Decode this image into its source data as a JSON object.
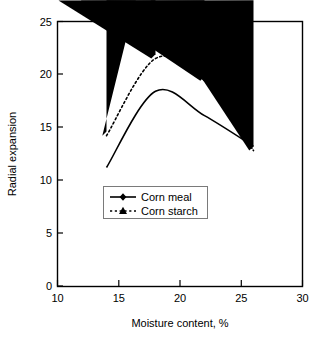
{
  "chart_data": {
    "type": "line",
    "title": "",
    "xlabel": "Moisture content, %",
    "ylabel": "Radial expansion",
    "xlim": [
      10,
      30
    ],
    "ylim": [
      0,
      25
    ],
    "xticks": [
      10,
      15,
      20,
      25,
      30
    ],
    "yticks": [
      0,
      5,
      10,
      15,
      20,
      25
    ],
    "xtick_labels": [
      "10",
      "15",
      "20",
      "25",
      "30"
    ],
    "ytick_labels": [
      "0",
      "5",
      "10",
      "15",
      "20",
      "25"
    ],
    "grid": false,
    "legend_position": "center-left-inside",
    "frame": true,
    "series": [
      {
        "name": "Corn meal",
        "marker": "diamond",
        "linestyle": "solid",
        "color": "#000000",
        "x": [
          14,
          18,
          22,
          26
        ],
        "values": [
          11.2,
          18.4,
          16.1,
          13.2
        ]
      },
      {
        "name": "Corn starch",
        "marker": "triangle",
        "linestyle": "dotted",
        "color": "#000000",
        "x": [
          14,
          18,
          22,
          26
        ],
        "values": [
          14.2,
          21.5,
          19.4,
          12.8
        ]
      }
    ]
  },
  "legend": {
    "entries": [
      {
        "label": "Corn meal"
      },
      {
        "label": "Corn starch"
      }
    ]
  }
}
